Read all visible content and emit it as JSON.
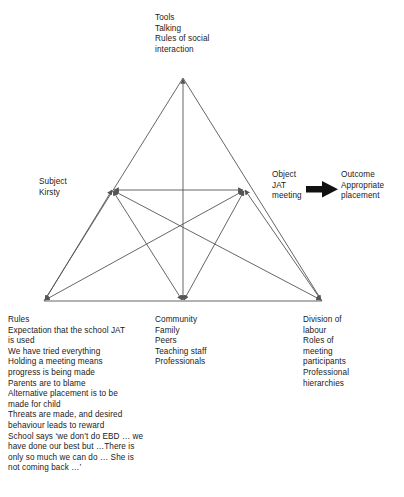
{
  "figure": {
    "type": "activity-system-triangle",
    "line_color": "#555555",
    "text_color": "#1a1a1a",
    "background": "#ffffff"
  },
  "nodes": {
    "tools": {
      "role": "Tools",
      "text": "Tools\nTalking\nRules of social\ninteraction"
    },
    "subject": {
      "role": "Subject",
      "text": "Subject\nKirsty"
    },
    "object": {
      "role": "Object",
      "text": "Object\nJAT\nmeeting"
    },
    "outcome": {
      "role": "Outcome",
      "text": "Outcome\nAppropriate\nplacement"
    },
    "rules": {
      "role": "Rules",
      "text": "Rules\nExpectation that the school JAT\nis used\nWe have tried everything\nHolding a meeting means\nprogress is being made\nParents are to blame\nAlternative placement is to be\nmade for child\nThreats are made, and desired\nbehaviour leads to reward\nSchool says ‘we don’t do EBD … we\nhave done our best but …There is\nonly so much we can do … She is\nnot coming back …’"
    },
    "community": {
      "role": "Community",
      "text": "Community\nFamily\nPeers\nTeaching staff\nProfessionals"
    },
    "division_of_labour": {
      "role": "Division of labour",
      "text": "Division of\nlabour\nRoles of\nmeeting\nparticipants\nProfessional\nhierarchies"
    }
  },
  "arrow": {
    "name": "object-to-outcome-arrow",
    "direction": "right",
    "from": "Object JAT meeting",
    "to": "Outcome Appropriate placement"
  },
  "geometry": {
    "apex": [
      183,
      78
    ],
    "bottom_left": [
      44,
      301
    ],
    "bottom_right": [
      322,
      301
    ],
    "mid_left": [
      113,
      190
    ],
    "mid_right": [
      244,
      190
    ],
    "bottom_center": [
      183,
      301
    ],
    "center": [
      183,
      232
    ]
  }
}
